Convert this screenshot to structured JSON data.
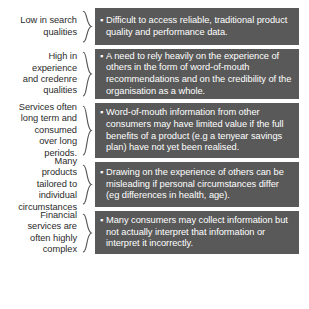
{
  "diagram": {
    "type": "paired-label-brace-callout-list",
    "bullet_glyph": "square-bullet",
    "colors": {
      "box_fill": "#595959",
      "box_text": "#ffffff",
      "label_text": "#2b2b2b",
      "brace_stroke": "#575757",
      "background": "#ffffff"
    },
    "rows": [
      {
        "label": "Low in search\nqualities",
        "brace": "curly-brace-right",
        "bullets": [
          "Difficult to access reliable, traditional product quality and performance data."
        ]
      },
      {
        "label": "High in\nexperience\nand credenre\nqualities",
        "brace": "curly-brace-right",
        "bullets": [
          "A need to rely heavily on the experience of others in the form of word-of-mouth recommendations and on the credibility of the organisation as a whole."
        ]
      },
      {
        "label": "Services often\nlong term and\nconsumed\nover long\nperiods.",
        "brace": "curly-brace-right",
        "bullets": [
          "Word-of-mouth information from other consumers may have limited value if the full benefits of a product (e.g a tenyear savings plan) have not yet been realised."
        ]
      },
      {
        "label": "Many\nproducts\ntailored to\nindividual\ncircumstances",
        "brace": "curly-brace-right",
        "bullets": [
          "Drawing on the experience of others can be misleading if personal circumstances differ (eg differences in health, age)."
        ]
      },
      {
        "label": "Financial\nservices are\noften highly\ncomplex",
        "brace": "curly-brace-right",
        "bullets": [
          "Many consumers may collect information but not actually interpret that information or interpret it incorrectly."
        ]
      }
    ]
  }
}
